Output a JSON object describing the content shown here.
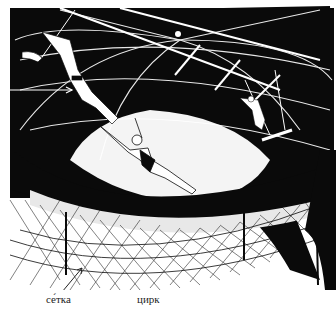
{
  "illustration": {
    "subject": "circus trapeze act under a dark dome with a safety net",
    "colors": {
      "ink": "#0a0a0a",
      "paper": "#ffffff",
      "highlight": "#f4f4f4"
    }
  },
  "labels": {
    "net": "се́тка",
    "circus": "цирк"
  }
}
